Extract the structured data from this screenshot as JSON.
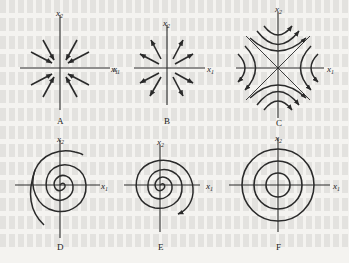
{
  "figure": {
    "panels": [
      {
        "id": "A",
        "label": "A",
        "x_axis": "x1",
        "y_axis": "x2",
        "type": "stable-node",
        "arrows": "inward"
      },
      {
        "id": "B",
        "label": "B",
        "x_axis": "x1",
        "y_axis": "x2",
        "x_axis_left": "x1",
        "type": "unstable-node",
        "arrows": "outward"
      },
      {
        "id": "C",
        "label": "C",
        "x_axis": "x1",
        "y_axis": "x2",
        "type": "saddle"
      },
      {
        "id": "D",
        "label": "D",
        "x_axis": "x1",
        "y_axis": "x2",
        "type": "spiral"
      },
      {
        "id": "E",
        "label": "E",
        "x_axis": "x1",
        "y_axis": "x2",
        "type": "spiral"
      },
      {
        "id": "F",
        "label": "F",
        "x_axis": "x1",
        "y_axis": "x2",
        "type": "center"
      }
    ],
    "colors": {
      "ink": "#2a2a2a",
      "paper": "#f4f3f0"
    }
  }
}
